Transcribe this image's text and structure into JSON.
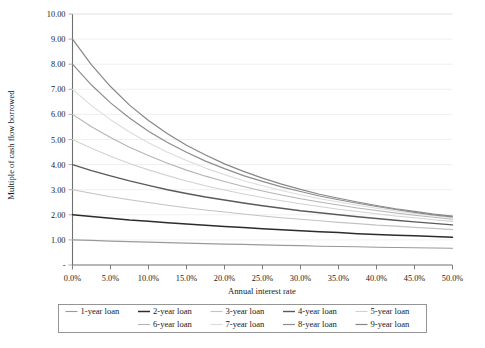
{
  "chart_data": {
    "type": "line",
    "title": "",
    "xlabel": "Annual interest rate",
    "ylabel": "Multiple of cash flow borrowed",
    "xlim": [
      0,
      50
    ],
    "ylim": [
      0,
      10
    ],
    "grid": true,
    "legend_position": "bottom",
    "x_tick_labels": [
      "0.0%",
      "5.0%",
      "10.0%",
      "15.0%",
      "20.0%",
      "25.0%",
      "30.0%",
      "35.0%",
      "40.0%",
      "45.0%",
      "50.0%"
    ],
    "x_tick_values": [
      0,
      5,
      10,
      15,
      20,
      25,
      30,
      35,
      40,
      45,
      50
    ],
    "y_tick_labels": [
      "-",
      "1.00",
      "2.00",
      "3.00",
      "4.00",
      "5.00",
      "6.00",
      "7.00",
      "8.00",
      "9.00",
      "10.00"
    ],
    "y_tick_values": [
      0,
      1,
      2,
      3,
      4,
      5,
      6,
      7,
      8,
      9,
      10
    ],
    "x": [
      0,
      2.5,
      5,
      7.5,
      10,
      12.5,
      15,
      17.5,
      20,
      22.5,
      25,
      27.5,
      30,
      32.5,
      35,
      37.5,
      40,
      42.5,
      45,
      47.5,
      50
    ],
    "series": [
      {
        "name": "1-year loan",
        "color": "#9a9a9a",
        "width": 1.1,
        "values": [
          1.0,
          0.98,
          0.95,
          0.93,
          0.91,
          0.89,
          0.87,
          0.85,
          0.83,
          0.82,
          0.8,
          0.78,
          0.77,
          0.75,
          0.74,
          0.73,
          0.71,
          0.7,
          0.69,
          0.68,
          0.67
        ]
      },
      {
        "name": "2-year loan",
        "color": "#2c2c2c",
        "width": 1.5,
        "values": [
          2.0,
          1.93,
          1.86,
          1.79,
          1.74,
          1.68,
          1.63,
          1.58,
          1.53,
          1.49,
          1.44,
          1.4,
          1.36,
          1.32,
          1.29,
          1.25,
          1.22,
          1.19,
          1.17,
          1.14,
          1.11
        ]
      },
      {
        "name": "3-year loan",
        "color": "#c3c3c3",
        "width": 1.1,
        "values": [
          3.0,
          2.86,
          2.72,
          2.6,
          2.49,
          2.38,
          2.28,
          2.19,
          2.11,
          2.03,
          1.95,
          1.88,
          1.82,
          1.76,
          1.7,
          1.65,
          1.59,
          1.55,
          1.5,
          1.46,
          1.41
        ]
      },
      {
        "name": "4-year loan",
        "color": "#5a5a5a",
        "width": 1.4,
        "values": [
          4.0,
          3.76,
          3.55,
          3.35,
          3.17,
          3.0,
          2.85,
          2.71,
          2.59,
          2.47,
          2.36,
          2.26,
          2.16,
          2.08,
          2.0,
          1.92,
          1.85,
          1.78,
          1.72,
          1.66,
          1.6
        ]
      },
      {
        "name": "5-year loan",
        "color": "#d2d2d2",
        "width": 1.1,
        "values": [
          5.0,
          4.65,
          4.33,
          4.04,
          3.79,
          3.56,
          3.35,
          3.16,
          2.99,
          2.83,
          2.69,
          2.56,
          2.44,
          2.33,
          2.22,
          2.13,
          2.04,
          1.95,
          1.88,
          1.8,
          1.74
        ]
      },
      {
        "name": "6-year loan",
        "color": "#b5b5b5",
        "width": 1.1,
        "values": [
          6.0,
          5.51,
          5.08,
          4.69,
          4.36,
          4.05,
          3.78,
          3.54,
          3.33,
          3.13,
          2.95,
          2.79,
          2.64,
          2.51,
          2.39,
          2.27,
          2.17,
          2.07,
          1.98,
          1.9,
          1.82
        ]
      },
      {
        "name": "7-year loan",
        "color": "#dcdcdc",
        "width": 1.1,
        "values": [
          7.0,
          6.35,
          5.79,
          5.3,
          4.87,
          4.49,
          4.16,
          3.86,
          3.6,
          3.36,
          3.16,
          2.97,
          2.8,
          2.64,
          2.51,
          2.38,
          2.26,
          2.15,
          2.05,
          1.96,
          1.88
        ]
      },
      {
        "name": "8-year loan",
        "color": "#8d8d8d",
        "width": 1.2,
        "values": [
          8.0,
          7.17,
          6.46,
          5.86,
          5.33,
          4.88,
          4.49,
          4.14,
          3.84,
          3.56,
          3.33,
          3.11,
          2.93,
          2.75,
          2.6,
          2.46,
          2.33,
          2.21,
          2.1,
          2.0,
          1.92
        ]
      },
      {
        "name": "9-year loan",
        "color": "#878787",
        "width": 1.2,
        "values": [
          9.0,
          7.97,
          7.11,
          6.37,
          5.76,
          5.23,
          4.77,
          4.38,
          4.03,
          3.73,
          3.46,
          3.22,
          3.01,
          2.82,
          2.66,
          2.51,
          2.37,
          2.24,
          2.14,
          2.03,
          1.95
        ]
      }
    ]
  },
  "legend": {
    "rows": [
      [
        "1-year loan",
        "2-year loan",
        "3-year loan",
        "4-year loan",
        "5-year loan"
      ],
      [
        "6-year loan",
        "7-year loan",
        "8-year loan",
        "9-year loan"
      ]
    ]
  }
}
